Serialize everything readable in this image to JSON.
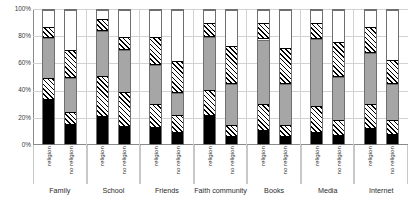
{
  "chart_data": {
    "type": "bar",
    "subtype": "100% stacked column",
    "title": "",
    "xlabel": "",
    "ylabel": "",
    "ylim": [
      0,
      100
    ],
    "ytick_labels": [
      "0%",
      "20%",
      "40%",
      "60%",
      "80%",
      "100%"
    ],
    "ytick_values": [
      0,
      20,
      40,
      60,
      80,
      100
    ],
    "grid": true,
    "legend": "none",
    "categories": [
      "Family",
      "School",
      "Friends",
      "Faith community",
      "Books",
      "Media",
      "Internet"
    ],
    "subgroups": [
      "religion",
      "no religion"
    ],
    "series": [
      {
        "name": "segment-1-black",
        "pattern": "solid-black",
        "color": "#000000"
      },
      {
        "name": "segment-2-hatched",
        "pattern": "diagonal-hatch",
        "color": "#ffffff"
      },
      {
        "name": "segment-3-gray",
        "pattern": "solid-gray",
        "color": "#a6a6a6"
      },
      {
        "name": "segment-4-hatched",
        "pattern": "diagonal-hatch",
        "color": "#ffffff"
      },
      {
        "name": "segment-5-white",
        "pattern": "solid-white",
        "color": "#ffffff"
      }
    ],
    "bars": [
      {
        "category": "Family",
        "subgroup": "religion",
        "values": [
          33,
          16,
          30,
          8,
          13
        ]
      },
      {
        "category": "Family",
        "subgroup": "no religion",
        "values": [
          14,
          10,
          25,
          21,
          30
        ]
      },
      {
        "category": "School",
        "subgroup": "religion",
        "values": [
          20,
          31,
          33,
          9,
          7
        ]
      },
      {
        "category": "School",
        "subgroup": "no religion",
        "values": [
          13,
          26,
          31,
          10,
          20
        ]
      },
      {
        "category": "Friends",
        "subgroup": "religion",
        "values": [
          12,
          18,
          29,
          21,
          20
        ]
      },
      {
        "category": "Friends",
        "subgroup": "no religion",
        "values": [
          8,
          14,
          16,
          24,
          38
        ]
      },
      {
        "category": "Faith community",
        "subgroup": "religion",
        "values": [
          21,
          19,
          40,
          10,
          10
        ]
      },
      {
        "category": "Faith community",
        "subgroup": "no religion",
        "values": [
          5,
          9,
          31,
          28,
          27
        ]
      },
      {
        "category": "Books",
        "subgroup": "religion",
        "values": [
          10,
          20,
          48,
          12,
          10
        ]
      },
      {
        "category": "Books",
        "subgroup": "no religion",
        "values": [
          5,
          9,
          31,
          27,
          28
        ]
      },
      {
        "category": "Media",
        "subgroup": "religion",
        "values": [
          8,
          20,
          50,
          12,
          10
        ]
      },
      {
        "category": "Media",
        "subgroup": "no religion",
        "values": [
          6,
          12,
          32,
          26,
          24
        ]
      },
      {
        "category": "Internet",
        "subgroup": "religion",
        "values": [
          11,
          19,
          38,
          19,
          13
        ]
      },
      {
        "category": "Internet",
        "subgroup": "no religion",
        "values": [
          7,
          11,
          27,
          18,
          37
        ]
      }
    ]
  }
}
